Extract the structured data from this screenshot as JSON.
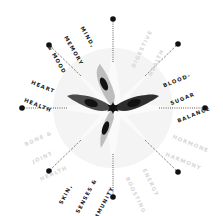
{
  "diagram": {
    "type": "radial-wheel",
    "center": {
      "x": 113,
      "y": 108
    },
    "colors": {
      "background": "#ffffff",
      "halo": "#f3f3f3",
      "ray": "#f8f8f8",
      "spoke": "#333333",
      "dot": "#111111",
      "petal_dark": "#4a4a4a",
      "petal_light": "#bdbdbd",
      "petal_eye": "#111111",
      "hub": "#111111",
      "text_active": "#1a1a1a",
      "text_faded": "#d6d6d6"
    },
    "categories": [
      {
        "id": "mind",
        "lines": [
          "MIND,",
          "MEMORY",
          "& MOOD"
        ],
        "active": true,
        "angle": -112
      },
      {
        "id": "digestive",
        "lines": [
          "DIGESTIVE",
          "HEALTH"
        ],
        "active": false,
        "angle": -68
      },
      {
        "id": "blood-sugar",
        "lines": [
          "BLOOD-",
          "SUGAR",
          "BALANCE"
        ],
        "active": true,
        "angle": -22
      },
      {
        "id": "hormone",
        "lines": [
          "HORMONE",
          "HARMONY"
        ],
        "active": false,
        "angle": 22
      },
      {
        "id": "energy",
        "lines": [
          "ENERGY",
          "BOOSTING"
        ],
        "active": false,
        "angle": 68
      },
      {
        "id": "skin",
        "lines": [
          "SKIN,",
          "SENSES &",
          "IMMUNITY"
        ],
        "active": true,
        "angle": 112
      },
      {
        "id": "bone",
        "lines": [
          "BONE &",
          "JOINT",
          "HEALTH"
        ],
        "active": false,
        "angle": 158
      },
      {
        "id": "heart",
        "lines": [
          "HEART",
          "HEALTH"
        ],
        "active": true,
        "angle": -158
      }
    ],
    "spokes": [
      {
        "angle": -90
      },
      {
        "angle": -45
      },
      {
        "angle": 0
      },
      {
        "angle": 45
      },
      {
        "angle": 90
      },
      {
        "angle": 135
      },
      {
        "angle": 180
      },
      {
        "angle": -135
      }
    ],
    "petals": [
      {
        "name": "petal-left",
        "shade": "dark",
        "angle": -160
      },
      {
        "name": "petal-right",
        "shade": "dark",
        "angle": -20
      },
      {
        "name": "petal-upper",
        "shade": "light",
        "angle": -115
      },
      {
        "name": "petal-lower",
        "shade": "light",
        "angle": 110
      }
    ]
  },
  "labels": {
    "mind": {
      "l1": "MIND,",
      "l2": "MEMORY",
      "l3": "& MOOD"
    },
    "digestive": {
      "l1": "DIGESTIVE",
      "l2": "HEALTH"
    },
    "blood_sugar": {
      "l1": "BLOOD-",
      "l2": "SUGAR",
      "l3": "BALANCE"
    },
    "hormone": {
      "l1": "HORMONE",
      "l2": "HARMONY"
    },
    "energy": {
      "l1": "ENERGY",
      "l2": "BOOSTING"
    },
    "skin": {
      "l1": "SKIN,",
      "l2": "SENSES &",
      "l3": "IMMUNITY"
    },
    "bone": {
      "l1": "BONE &",
      "l2": "JOINT",
      "l3": "HEALTH"
    },
    "heart": {
      "l1": "HEART",
      "l2": "HEALTH"
    }
  }
}
